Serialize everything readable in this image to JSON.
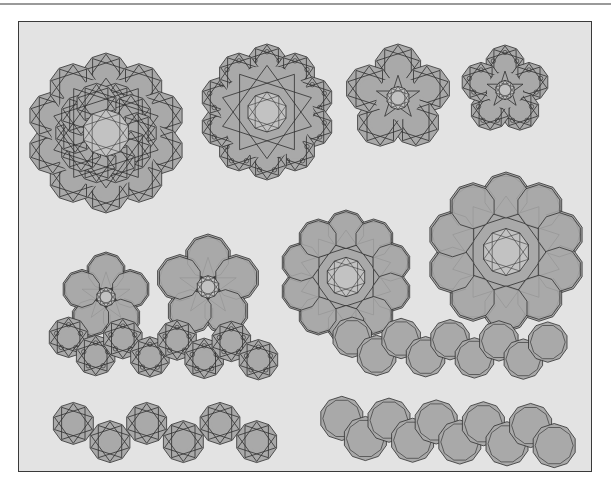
{
  "figure": {
    "title": "",
    "frame": {
      "x": 18,
      "y": 21,
      "width": 574,
      "height": 451
    },
    "colors": {
      "background": "#e3e3e3",
      "tile_fill": "#a9a9a9",
      "center_fill": "#c2c2c2",
      "line": "#2f2f2f",
      "border": "#3a3a3a",
      "top_rule": "#9a9a9a"
    },
    "rosettes": [
      {
        "name": "rosette-10fold-large-stars",
        "cx": 106,
        "cy": 133,
        "r": 80,
        "lobes": 10,
        "style": "stars",
        "rings": 2
      },
      {
        "name": "rosette-10fold-circles",
        "cx": 267,
        "cy": 112,
        "r": 68,
        "lobes": 10,
        "style": "stars-circles",
        "rings": 1
      },
      {
        "name": "rosette-5lobe-cluster",
        "cx": 398,
        "cy": 98,
        "r": 54,
        "lobes": 5,
        "style": "stars",
        "rings": 1
      },
      {
        "name": "rosette-5fold-small",
        "cx": 505,
        "cy": 90,
        "r": 45,
        "lobes": 5,
        "style": "stars-circles",
        "rings": 1
      },
      {
        "name": "rosette-5fold-decagons",
        "cx": 106,
        "cy": 297,
        "r": 45,
        "lobes": 5,
        "style": "decagons",
        "rings": 1
      },
      {
        "name": "rosette-5petal-decagons",
        "cx": 208,
        "cy": 287,
        "r": 53,
        "lobes": 5,
        "style": "decagons",
        "rings": 1
      },
      {
        "name": "rosette-10fold-decagons",
        "cx": 346,
        "cy": 277,
        "r": 67,
        "lobes": 10,
        "style": "decagons",
        "rings": 1
      },
      {
        "name": "rosette-10fold-decagon-ring-large",
        "cx": 506,
        "cy": 252,
        "r": 80,
        "lobes": 10,
        "style": "decagons",
        "rings": 1
      }
    ],
    "strips": [
      {
        "name": "strip-stars-circles",
        "x": 55,
        "y": 321,
        "width": 217,
        "height": 55,
        "count": 8,
        "style": "stars-circles",
        "skew": 12
      },
      {
        "name": "strip-decagons",
        "x": 340,
        "y": 321,
        "width": 220,
        "height": 55,
        "count": 9,
        "style": "decagons",
        "skew": 12
      },
      {
        "name": "strip-stars-wavy",
        "x": 55,
        "y": 404,
        "width": 220,
        "height": 57,
        "count": 6,
        "style": "stars",
        "skew": 0
      },
      {
        "name": "strip-decagons-staggered",
        "x": 330,
        "y": 402,
        "width": 236,
        "height": 60,
        "count": 10,
        "style": "decagons",
        "skew": 20
      }
    ]
  }
}
